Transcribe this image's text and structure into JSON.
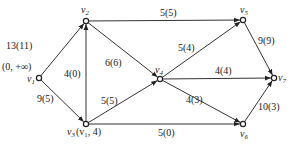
{
  "nodes": [
    {
      "id": "v1",
      "label": "v",
      "sub": "1",
      "x": 39,
      "y": 78,
      "lx": 27,
      "ly": 82,
      "anno": "(0, +∞)",
      "ax": 2,
      "ay": 70
    },
    {
      "id": "v2",
      "label": "v",
      "sub": "2",
      "x": 86,
      "y": 21,
      "lx": 81,
      "ly": 13
    },
    {
      "id": "v3",
      "label": "v",
      "sub": "3",
      "x": 86,
      "y": 124,
      "lx": 67,
      "ly": 135,
      "anno": "(v₁, 4)",
      "ax": 76,
      "ay": 135
    },
    {
      "id": "v4",
      "label": "v",
      "sub": "4",
      "x": 160,
      "y": 79,
      "lx": 155,
      "ly": 73
    },
    {
      "id": "v5",
      "label": "v",
      "sub": "5",
      "x": 243,
      "y": 20,
      "lx": 240,
      "ly": 13
    },
    {
      "id": "v6",
      "label": "v",
      "sub": "6",
      "x": 243,
      "y": 124,
      "lx": 240,
      "ly": 137
    },
    {
      "id": "v7",
      "label": "v",
      "sub": "7",
      "x": 274,
      "y": 78,
      "lx": 278,
      "ly": 81
    }
  ],
  "edges": [
    {
      "from": "v1",
      "to": "v2",
      "label": "13(11)",
      "lx": 6,
      "ly": 49
    },
    {
      "from": "v1",
      "to": "v3",
      "label": "9(5)",
      "lx": 37,
      "ly": 102
    },
    {
      "from": "v3",
      "to": "v2",
      "label": "4(0)",
      "lx": 64,
      "ly": 77
    },
    {
      "from": "v2",
      "to": "v4",
      "label": "6(6)",
      "lx": 105,
      "ly": 66
    },
    {
      "from": "v2",
      "to": "v5",
      "label": "5(5)",
      "lx": 160,
      "ly": 16
    },
    {
      "from": "v3",
      "to": "v4",
      "label": "5(5)",
      "lx": 101,
      "ly": 104
    },
    {
      "from": "v3",
      "to": "v6",
      "label": "5(0)",
      "lx": 158,
      "ly": 136
    },
    {
      "from": "v4",
      "to": "v5",
      "label": "5(4)",
      "lx": 178,
      "ly": 51
    },
    {
      "from": "v4",
      "to": "v7",
      "label": "4(4)",
      "lx": 215,
      "ly": 74
    },
    {
      "from": "v4",
      "to": "v6",
      "label": "4(3)",
      "lx": 186,
      "ly": 103
    },
    {
      "from": "v5",
      "to": "v7",
      "label": "9(9)",
      "lx": 258,
      "ly": 44
    },
    {
      "from": "v6",
      "to": "v7",
      "label": "10(3)",
      "lx": 258,
      "ly": 110
    }
  ]
}
